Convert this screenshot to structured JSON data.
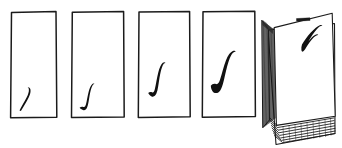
{
  "figure": {
    "title": "Sequence of sketched page frames with growing curve strokes",
    "background_color": "#ffffff",
    "ink_color": "#111111",
    "outline_color": "#1b1b1b",
    "width": 342,
    "height": 148,
    "medium": "hand-drawn pen sketch"
  },
  "panels": [
    {
      "index": 1,
      "name": "panel-1",
      "description": "Empty rectangular page frame with a small short curved pen stroke low in the lower-left corner",
      "stroke_label": "small-curve",
      "stroke_size": "small",
      "stroke_position": "lower-left",
      "x": 10,
      "y": 11,
      "width": 47,
      "height": 107
    },
    {
      "index": 2,
      "name": "panel-2",
      "description": "Rectangular page frame with a slightly larger S-shaped pen stroke near the lower-left",
      "stroke_label": "s-curve",
      "stroke_size": "small-medium",
      "stroke_position": "lower-left",
      "x": 71,
      "y": 11,
      "width": 53,
      "height": 107
    },
    {
      "index": 3,
      "name": "panel-3",
      "description": "Rectangular page frame with a medium integral-shaped pen stroke positioned higher and centered",
      "stroke_label": "integral-curve",
      "stroke_size": "medium",
      "stroke_position": "center-left",
      "x": 138,
      "y": 11,
      "width": 52,
      "height": 107
    },
    {
      "index": 4,
      "name": "panel-4",
      "description": "Rectangular page frame with a thick bold S-curve pen stroke in the middle of the page",
      "stroke_label": "bold-s-curve",
      "stroke_size": "large",
      "stroke_position": "center",
      "x": 202,
      "y": 11,
      "width": 53,
      "height": 107
    }
  ],
  "stack": {
    "name": "page-stack",
    "description": "Thick stack of many sheets drawn in perspective, top sheet shows the largest hooked curve stroke and a small dark dash mark near the top edge",
    "stroke_label": "large-hook-curve",
    "stroke_size": "largest",
    "sheet_count_appearance": "many",
    "mark_label": "dark-dash-mark",
    "x": 258,
    "y": 12,
    "width": 78,
    "height": 134
  },
  "caption": {
    "text": ""
  }
}
